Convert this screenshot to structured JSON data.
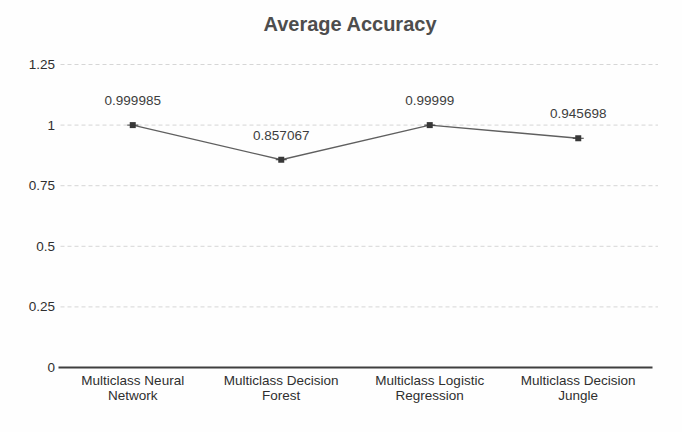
{
  "chart_data": {
    "type": "line",
    "title": "Average Accuracy",
    "categories": [
      "Multiclass Neural Network",
      "Multiclass Decision Forest",
      "Multiclass Logistic Regression",
      "Multiclass Decision Jungle"
    ],
    "category_lines": [
      [
        "Multiclass Neural",
        "Network"
      ],
      [
        "Multiclass Decision",
        "Forest"
      ],
      [
        "Multiclass Logistic",
        "Regression"
      ],
      [
        "Multiclass Decision",
        "Jungle"
      ]
    ],
    "values": [
      0.999985,
      0.857067,
      0.99999,
      0.945698
    ],
    "point_labels": [
      "0.999985",
      "0.857067",
      "0.99999",
      "0.945698"
    ],
    "xlabel": "",
    "ylabel": "",
    "ylim": [
      0,
      1.25
    ],
    "yticks": [
      0,
      0.25,
      0.5,
      0.75,
      1,
      1.25
    ],
    "ytick_labels": [
      "0",
      "0.25",
      "0.5",
      "0.75",
      "1",
      "1.25"
    ],
    "grid": "horizontal-dashed",
    "legend_position": "none",
    "colors": {
      "title": "#4d4d4d",
      "line": "#5f5f5f",
      "marker": "#383838",
      "gridline": "#d6d6d6",
      "axis_line": "#3f3f3f",
      "tick_label": "#2f2f2f",
      "data_label": "#3d3d3d",
      "category_label": "#2f2f2f"
    }
  }
}
